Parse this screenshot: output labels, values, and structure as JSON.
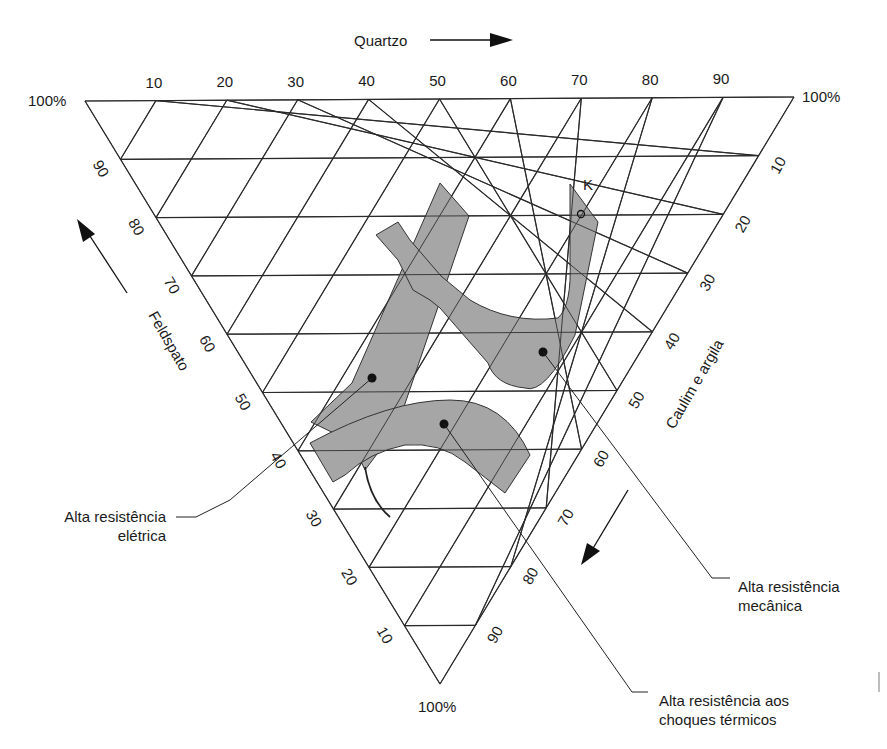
{
  "diagram": {
    "type": "ternary",
    "axes": {
      "top": {
        "name": "Quartzo",
        "ticks": [
          "10",
          "20",
          "30",
          "40",
          "50",
          "60",
          "70",
          "80",
          "90"
        ],
        "arrow": "right"
      },
      "left": {
        "name": "Feldspato",
        "ticks": [
          "90",
          "80",
          "70",
          "60",
          "50",
          "40",
          "30",
          "20",
          "10"
        ],
        "arrow": "up-left"
      },
      "right": {
        "name": "Caulim e argila",
        "ticks": [
          "10",
          "20",
          "30",
          "40",
          "50",
          "60",
          "70",
          "80",
          "90"
        ],
        "arrow": "down-left"
      }
    },
    "vertex_labels": {
      "top_left": "100%",
      "top_right": "100%",
      "bottom": "100%"
    },
    "point_label": "K",
    "regions": [
      {
        "id": "eletrica",
        "label_line1": "Alta resistência",
        "label_line2": "elétrica",
        "fill": "#a6a6a6"
      },
      {
        "id": "mecanica",
        "label_line1": "Alta resistência",
        "label_line2": "mecânica",
        "fill": "#a6a6a6"
      },
      {
        "id": "termica",
        "label_line1": "Alta resistência aos",
        "label_line2": "choques térmicos",
        "fill": "#a6a6a6"
      }
    ],
    "colors": {
      "line": "#2a2a2a",
      "region_fill": "#a6a6a6",
      "background": "#ffffff"
    }
  }
}
